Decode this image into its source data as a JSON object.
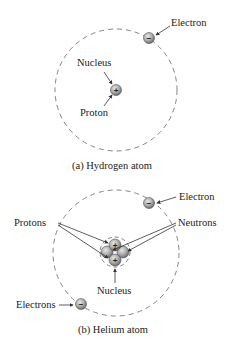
{
  "hydrogen": {
    "caption": "(a) Hydrogen atom",
    "labels": {
      "electron": "Electron",
      "nucleus": "Nucleus",
      "proton": "Proton"
    },
    "electron_sign": "−",
    "proton_sign": "+"
  },
  "helium": {
    "caption": "(b) Helium atom",
    "labels": {
      "electron": "Electron",
      "electrons": "Electrons",
      "protons": "Protons",
      "neutrons": "Neutrons",
      "nucleus": "Nucleus"
    },
    "electron_sign": "−",
    "proton_sign": "+"
  },
  "colors": {
    "particle_fill": "#a8a8a8",
    "particle_stroke": "#555555",
    "orbit": "#777777",
    "text": "#222222"
  }
}
